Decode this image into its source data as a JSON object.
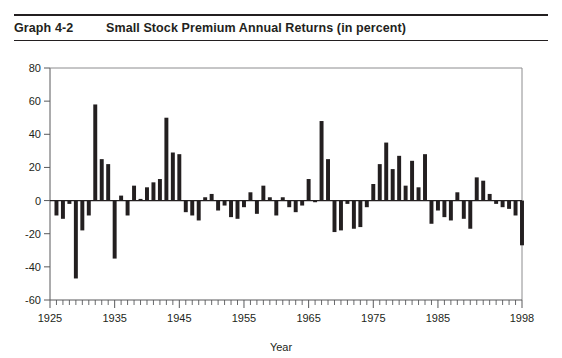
{
  "header": {
    "graph_label": "Graph 4-2",
    "title": "Small Stock Premium Annual Returns (in percent)"
  },
  "chart_data": {
    "type": "bar",
    "title": "Small Stock Premium Annual Returns (in percent)",
    "xlabel": "Year",
    "ylabel": "",
    "xlim": [
      1925,
      1998
    ],
    "ylim": [
      -60,
      80
    ],
    "ytick_labels": [
      "80",
      "60",
      "40",
      "20",
      "0",
      "-20",
      "-40",
      "-60"
    ],
    "yticks": [
      80,
      60,
      40,
      20,
      0,
      -20,
      -40,
      -60
    ],
    "xtick_labels": [
      "1925",
      "1935",
      "1945",
      "1955",
      "1965",
      "1975",
      "1985",
      "1998"
    ],
    "xticks": [
      1925,
      1935,
      1945,
      1955,
      1965,
      1975,
      1985,
      1998
    ],
    "grid": false,
    "legend": "none",
    "bar_color": "#231f20",
    "categories": [
      1926,
      1927,
      1928,
      1929,
      1930,
      1931,
      1932,
      1933,
      1934,
      1935,
      1936,
      1937,
      1938,
      1939,
      1940,
      1941,
      1942,
      1943,
      1944,
      1945,
      1946,
      1947,
      1948,
      1949,
      1950,
      1951,
      1952,
      1953,
      1954,
      1955,
      1956,
      1957,
      1958,
      1959,
      1960,
      1961,
      1962,
      1963,
      1964,
      1965,
      1966,
      1967,
      1968,
      1969,
      1970,
      1971,
      1972,
      1973,
      1974,
      1975,
      1976,
      1977,
      1978,
      1979,
      1980,
      1981,
      1982,
      1983,
      1984,
      1985,
      1986,
      1987,
      1988,
      1989,
      1990,
      1991,
      1992,
      1993,
      1994,
      1995,
      1996,
      1997,
      1998
    ],
    "values": [
      -9,
      -11,
      -2,
      -47,
      -18,
      -9,
      58,
      25,
      22,
      -35,
      3,
      -9,
      9,
      1,
      8,
      11,
      13,
      50,
      29,
      28,
      -7,
      -9,
      -12,
      2,
      4,
      -6,
      -3,
      -10,
      -11,
      -4,
      5,
      -8,
      9,
      2,
      -9,
      2,
      -4,
      -7,
      -3,
      13,
      -1,
      48,
      25,
      -19,
      -18,
      -2,
      -17,
      -16,
      -4,
      10,
      22,
      35,
      19,
      27,
      9,
      24,
      8,
      28,
      -14,
      -6,
      -10,
      -12,
      5,
      -11,
      -17,
      14,
      12,
      4,
      -2,
      -4,
      -5,
      -9,
      -27
    ]
  }
}
